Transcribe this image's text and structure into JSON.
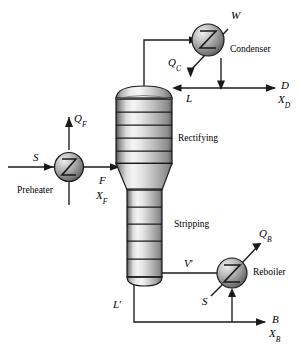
{
  "diagram": {
    "type": "process-flow-diagram",
    "colors": {
      "line": "#1a1a1a",
      "vessel_light": "#f2f2f2",
      "vessel_mid": "#b8b8b8",
      "vessel_dark": "#4d4d4d",
      "sphere_light": "#e8e8e8",
      "sphere_mid": "#9a9a9a",
      "sphere_dark": "#3f3f3f",
      "background": "#ffffff"
    }
  },
  "sections": {
    "rectifying_label": "Rectifying",
    "stripping_label": "Stripping"
  },
  "equipment": {
    "preheater_label": "Preheater",
    "condenser_label": "Condenser",
    "reboiler_label": "Reboiler"
  },
  "streams": {
    "steam_preheater": "S",
    "heat_preheater": "Q",
    "heat_preheater_sub": "F",
    "feed": "F",
    "feed_comp": "X",
    "feed_comp_sub": "F",
    "cooling_water": "W",
    "heat_condenser": "Q",
    "heat_condenser_sub": "C",
    "reflux": "L",
    "distillate": "D",
    "distillate_comp": "X",
    "distillate_comp_sub": "D",
    "boilup": "V",
    "boilup_prime": "′",
    "bottoms_liquid": "L",
    "bottoms_liquid_prime": "′",
    "steam_reboiler": "S",
    "heat_reboiler": "Q",
    "heat_reboiler_sub": "B",
    "bottoms": "B",
    "bottoms_comp": "X",
    "bottoms_comp_sub": "B"
  }
}
